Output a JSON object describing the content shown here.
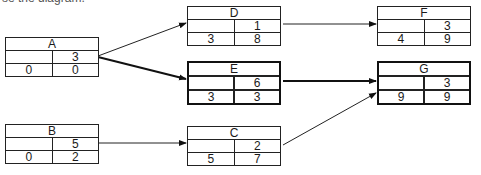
{
  "caption": "se the diagram.",
  "nodes": {
    "A": {
      "label": "A",
      "duration": "3",
      "start": "0",
      "finish": "0"
    },
    "B": {
      "label": "B",
      "duration": "5",
      "start": "0",
      "finish": "2"
    },
    "C": {
      "label": "C",
      "duration": "2",
      "start": "5",
      "finish": "7"
    },
    "D": {
      "label": "D",
      "duration": "1",
      "start": "3",
      "finish": "8"
    },
    "E": {
      "label": "E",
      "duration": "6",
      "start": "3",
      "finish": "3"
    },
    "F": {
      "label": "F",
      "duration": "3",
      "start": "4",
      "finish": "9"
    },
    "G": {
      "label": "G",
      "duration": "3",
      "start": "9",
      "finish": "9"
    }
  },
  "edges": [
    {
      "from": "A",
      "to": "D",
      "critical": false
    },
    {
      "from": "A",
      "to": "E",
      "critical": true
    },
    {
      "from": "B",
      "to": "C",
      "critical": false
    },
    {
      "from": "D",
      "to": "F",
      "critical": false
    },
    {
      "from": "E",
      "to": "G",
      "critical": true
    },
    {
      "from": "C",
      "to": "G",
      "critical": false
    }
  ]
}
